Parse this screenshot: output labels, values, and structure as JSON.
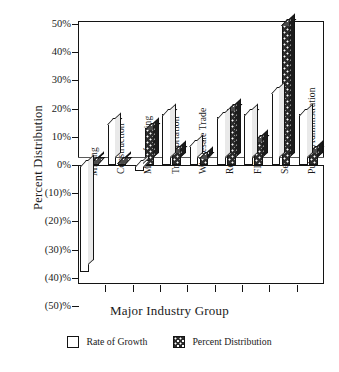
{
  "chart_data": {
    "type": "bar",
    "title": "",
    "xlabel": "Major Industry Group",
    "ylabel": "Percent Distribution",
    "ylim": [
      -50,
      50
    ],
    "ytick_values": [
      50,
      40,
      30,
      20,
      10,
      0,
      -10,
      -20,
      -30,
      -40,
      -50
    ],
    "ytick_labels": [
      "50%",
      "40%",
      "30%",
      "20%",
      "10%",
      "0%",
      "(10)%",
      "(20)%",
      "(30)%",
      "(40)%",
      "(50)%"
    ],
    "grid": false,
    "legend_position": "bottom",
    "categories": [
      "Mining",
      "Construction",
      "Manufacturing",
      "Transportation",
      "Wholesale Trade",
      "Retail Trade",
      "FIRE",
      "Services",
      "Public Administration"
    ],
    "series": [
      {
        "name": "Rate of Growth",
        "color": "#ffffff",
        "values": [
          -38,
          15,
          -2,
          18,
          7,
          17,
          18,
          26,
          18
        ]
      },
      {
        "name": "Percent Distribution",
        "color": "#2b2b2b",
        "values": [
          1,
          1,
          13,
          5,
          3,
          20,
          9,
          50,
          5
        ]
      }
    ]
  },
  "legend": {
    "items": [
      {
        "label": "Rate of Growth",
        "swatch": "white-square"
      },
      {
        "label": "Percent Distribution",
        "swatch": "dark-dotted-square"
      }
    ]
  },
  "colors": {
    "axis": "#141414",
    "growth_fill": "#ffffff",
    "distribution_fill": "#2b2b2b",
    "background": "#ffffff"
  }
}
